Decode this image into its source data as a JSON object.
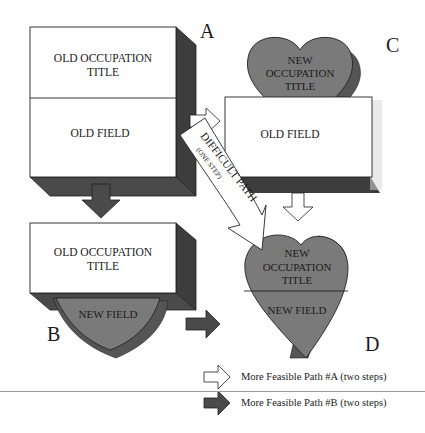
{
  "colors": {
    "box_fill": "#ffffff",
    "box_shadow": "#3d3d3d",
    "heart_fill": "#7a7a7a",
    "heart_shadow": "#4a4a4a",
    "arrow_dark": "#4a4a4a",
    "arrow_light": "#ffffff",
    "stroke": "#222222"
  },
  "panels": {
    "A": {
      "letter": "A",
      "top_text_1": "OLD OCCUPATION",
      "top_text_2": "TITLE",
      "bottom_text": "OLD FIELD"
    },
    "B": {
      "letter": "B",
      "top_text_1": "OLD OCCUPATION",
      "top_text_2": "TITLE",
      "bottom_text": "NEW FIELD"
    },
    "C": {
      "letter": "C",
      "top_text_1": "NEW",
      "top_text_2": "OCCUPATION",
      "top_text_3": "TITLE",
      "bottom_text": "OLD FIELD"
    },
    "D": {
      "letter": "D",
      "top_text_1": "NEW",
      "top_text_2": "OCCUPATION",
      "top_text_3": "TITLE",
      "bottom_text": "NEW FIELD"
    }
  },
  "difficult_path": {
    "label": "DIFFICULT PATH",
    "sublabel": "(ONE STEP)"
  },
  "legend": [
    {
      "style": "light-arrow",
      "label": "More Feasible Path #A (two steps)"
    },
    {
      "style": "dark-arrow",
      "label": "More Feasible Path #B (two steps)"
    }
  ]
}
